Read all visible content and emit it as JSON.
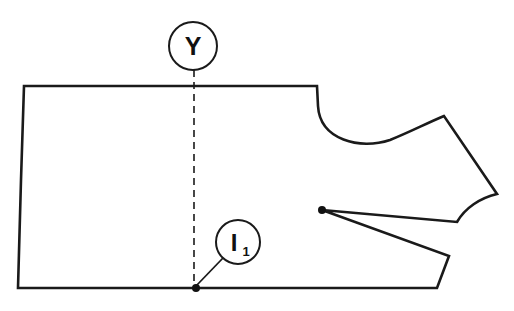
{
  "diagram": {
    "type": "pattern-piece",
    "stroke_color": "#1a1a1a",
    "background": "#ffffff",
    "labels": [
      {
        "id": "Y",
        "text": "Y",
        "subscript": ""
      },
      {
        "id": "I1",
        "text": "I",
        "subscript": "1"
      }
    ]
  }
}
